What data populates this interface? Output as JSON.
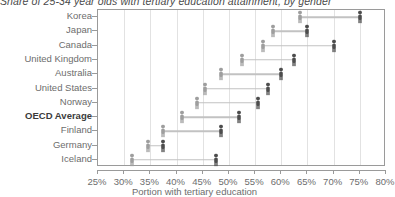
{
  "chart_data": {
    "type": "scatter",
    "title": "Share of 25-34 year olds with tertiary education attainment, by gender",
    "xlabel": "Portion with tertiary education",
    "ylabel": "",
    "xlim": [
      25,
      80
    ],
    "xticks": [
      25,
      30,
      35,
      40,
      45,
      50,
      55,
      60,
      65,
      70,
      75,
      80
    ],
    "xticklabels": [
      "25%",
      "30%",
      "35%",
      "40%",
      "45%",
      "50%",
      "55%",
      "60%",
      "65%",
      "70%",
      "75%",
      "80%"
    ],
    "grid": true,
    "legend": "none",
    "categories": [
      "Korea",
      "Japan",
      "Canada",
      "United Kingdom",
      "Australia",
      "United States",
      "Norway",
      "OECD Average",
      "Finland",
      "Germany",
      "Iceland"
    ],
    "highlight_category": "OECD Average",
    "series": [
      {
        "name": "Men",
        "color": "#9e9e9e",
        "marker": "person-icon",
        "values": [
          63.5,
          58.5,
          56.5,
          52.5,
          48.5,
          45.5,
          44.0,
          41.0,
          37.5,
          34.5,
          31.5
        ]
      },
      {
        "name": "Women",
        "color": "#4d4d4d",
        "marker": "person-icon",
        "values": [
          75.0,
          65.0,
          70.0,
          62.5,
          60.0,
          57.5,
          55.5,
          52.0,
          48.5,
          37.5,
          47.5
        ]
      }
    ]
  }
}
